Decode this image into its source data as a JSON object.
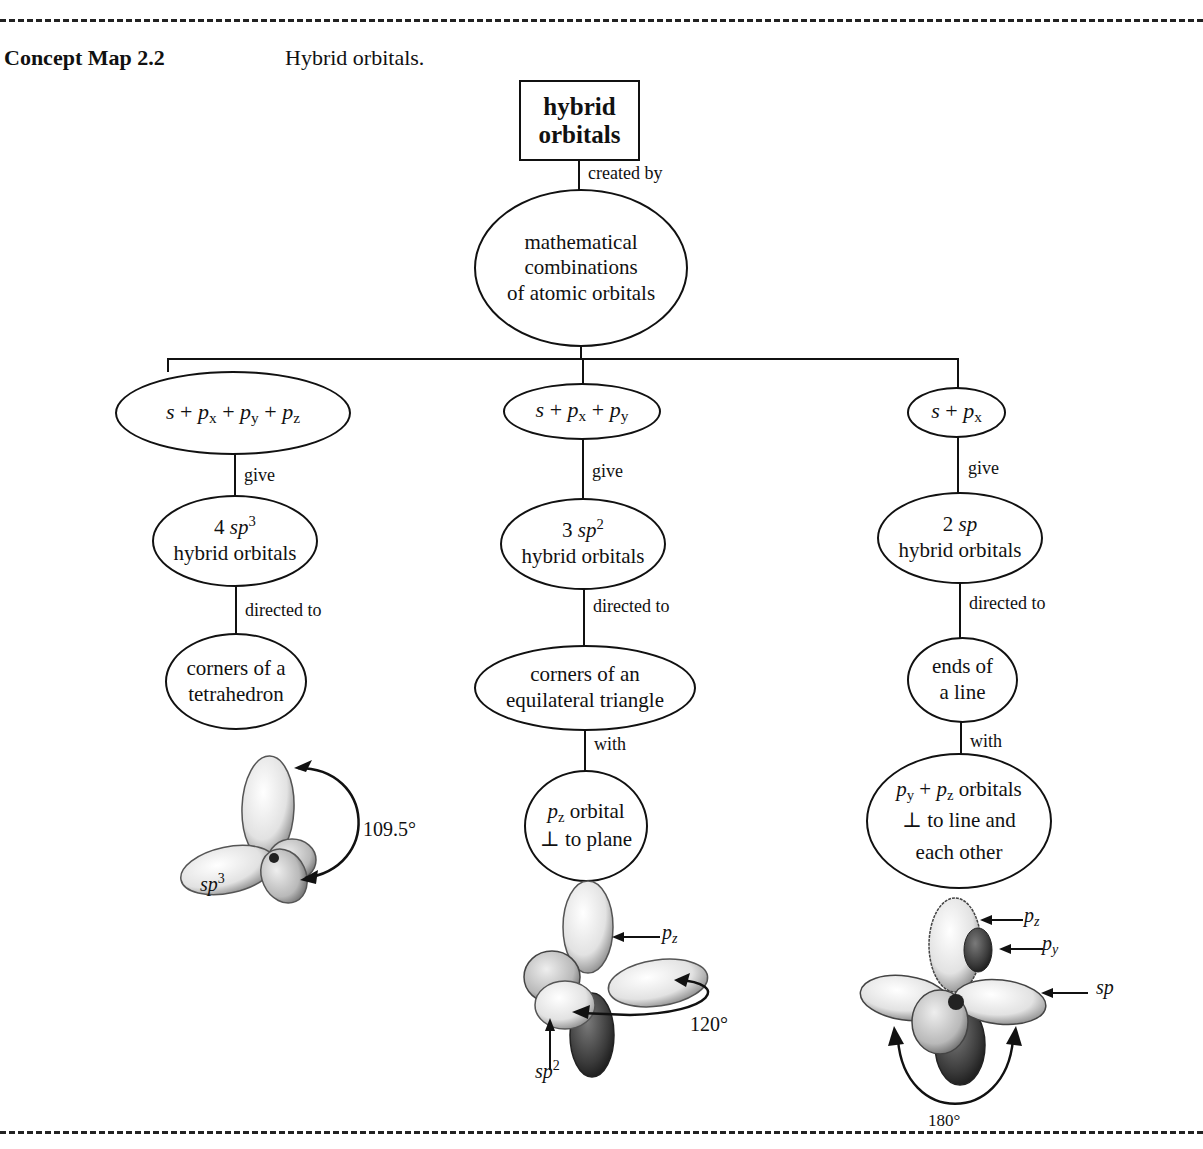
{
  "header": {
    "label": "Concept Map 2.2",
    "caption": "Hybrid orbitals."
  },
  "root": {
    "line1": "hybrid",
    "line2": "orbitals"
  },
  "root_link": "created by",
  "method": {
    "line1": "mathematical",
    "line2": "combinations",
    "line3": "of atomic orbitals"
  },
  "columns": [
    {
      "combo": {
        "s": "s",
        "plus": "+",
        "terms": [
          [
            "p",
            "x"
          ],
          [
            "p",
            "y"
          ],
          [
            "p",
            "z"
          ]
        ]
      },
      "give_link": "give",
      "hybrid": {
        "count": "4",
        "type": "sp",
        "exp": "3",
        "text": "hybrid orbitals"
      },
      "directed_link": "directed to",
      "geometry": {
        "line1": "corners of a",
        "line2": "tetrahedron"
      },
      "figure": {
        "angle": "109.5°",
        "label_base": "sp",
        "label_exp": "3"
      }
    },
    {
      "combo": {
        "s": "s",
        "plus": "+",
        "terms": [
          [
            "p",
            "x"
          ],
          [
            "p",
            "y"
          ]
        ]
      },
      "give_link": "give",
      "hybrid": {
        "count": "3",
        "type": "sp",
        "exp": "2",
        "text": "hybrid orbitals"
      },
      "directed_link": "directed to",
      "geometry": {
        "line1": "corners of an",
        "line2": "equilateral triangle"
      },
      "with_link": "with",
      "extra": {
        "p": "p",
        "sub": "z",
        "line1_rest": "orbital",
        "line2": "⊥ to plane"
      },
      "figure": {
        "angle": "120°",
        "pz_base": "p",
        "pz_sub": "z",
        "label_base": "sp",
        "label_exp": "2"
      }
    },
    {
      "combo": {
        "s": "s",
        "plus": "+",
        "terms": [
          [
            "p",
            "x"
          ]
        ]
      },
      "give_link": "give",
      "hybrid": {
        "count": "2",
        "type": "sp",
        "exp": "",
        "text": "hybrid orbitals"
      },
      "directed_link": "directed to",
      "geometry": {
        "line1": "ends of",
        "line2": "a line"
      },
      "with_link": "with",
      "extra": {
        "p1": "p",
        "sub1": "y",
        "plus": "+",
        "p2": "p",
        "sub2": "z",
        "line1_rest": "orbitals",
        "line2": "⊥ to line and",
        "line3": "each other"
      },
      "figure": {
        "angle": "180°",
        "pz_base": "p",
        "pz_sub": "z",
        "py_base": "p",
        "py_sub": "y",
        "sp_label": "sp"
      }
    }
  ],
  "colors": {
    "ink": "#111111",
    "lobe_light": "#f2f2f2",
    "lobe_mid": "#b5b5b5",
    "lobe_dark": "#3a3a3a"
  }
}
